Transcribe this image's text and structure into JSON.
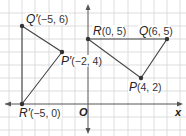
{
  "diagram": {
    "type": "coordinate-plane-rotation",
    "grid": {
      "x_min": -6,
      "x_max": 7,
      "y_min": -2,
      "y_max": 7,
      "unit_px": 13.15,
      "origin_px": [
        88,
        104
      ],
      "grid_color": "#cfcfcf",
      "line_color": "#444444",
      "axis_color": "#555555"
    },
    "axes": {
      "x_label": "x",
      "origin_label": "O"
    },
    "points": [
      {
        "id": "Q_prime",
        "name": "Q′",
        "coords_text": "(−5, 6)",
        "x": -5,
        "y": 6
      },
      {
        "id": "P_prime",
        "name": "P′",
        "coords_text": "(−2, 4)",
        "x": -2,
        "y": 4
      },
      {
        "id": "R_prime",
        "name": "R′",
        "coords_text": "(−5, 0)",
        "x": -5,
        "y": 0
      },
      {
        "id": "R",
        "name": "R",
        "coords_text": "(0, 5)",
        "x": 0,
        "y": 5
      },
      {
        "id": "Q",
        "name": "Q",
        "coords_text": "(6, 5)",
        "x": 6,
        "y": 5
      },
      {
        "id": "P",
        "name": "P",
        "coords_text": "(4, 2)",
        "x": 4,
        "y": 2
      }
    ],
    "triangles": [
      {
        "name": "PQR",
        "vertices": [
          "P",
          "Q",
          "R"
        ]
      },
      {
        "name": "P′Q′R′",
        "vertices": [
          "P_prime",
          "Q_prime",
          "R_prime"
        ]
      }
    ]
  }
}
